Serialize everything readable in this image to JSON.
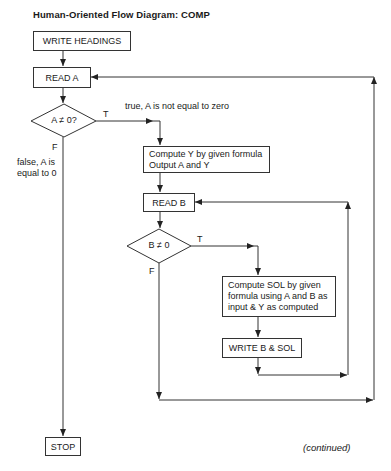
{
  "title": "Human-Oriented Flow Diagram: COMP",
  "nodes": {
    "write_headings": "WRITE HEADINGS",
    "read_a": "READ A",
    "decision_a": "A ≠ 0?",
    "compute_y": [
      "Compute Y by given formula",
      "Output A and Y"
    ],
    "read_b": "READ B",
    "decision_b": "B ≠ 0",
    "compute_sol": [
      "Compute SOL by given",
      "formula using A and B as",
      "input & Y as computed"
    ],
    "write_b_sol": "WRITE B & SOL",
    "stop": "STOP"
  },
  "labels": {
    "a_true": "T",
    "a_true_note": "true, A is not equal to zero",
    "a_false": "F",
    "a_false_note_1": "false, A is",
    "a_false_note_2": "equal to 0",
    "b_true": "T",
    "b_false": "F"
  },
  "footer": "(continued)",
  "colors": {
    "line": "#333333",
    "text": "#1a1a1a",
    "background": "#ffffff"
  }
}
